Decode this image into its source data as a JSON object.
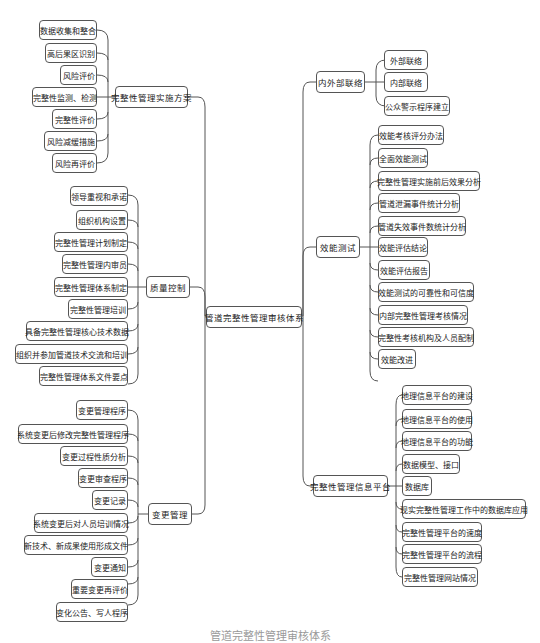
{
  "diagram": {
    "center": "管道完整性管理审核体系",
    "left_branches": [
      {
        "label": "完整性管理实施方案",
        "children": [
          "数据收集和整合",
          "高后果区识别",
          "风险评价",
          "完整性监测、检测",
          "完整性评价",
          "风险减缓措施",
          "风险再评价"
        ]
      },
      {
        "label": "质量控制",
        "children": [
          "领导重视和承诺",
          "组织机构设置",
          "完整性管理计划制定",
          "完整性管理内审员",
          "完整性管理体系制定",
          "完整性管理培训",
          "具备完整性管理核心技术数据",
          "组织并参加管道技术交流和培训",
          "完整性管理体系文件要点"
        ]
      },
      {
        "label": "变更管理",
        "children": [
          "变更管理程序",
          "系统变更后修改完整性管理程序",
          "变更过程性质分析",
          "变更审查程序",
          "变更记录",
          "系统变更后对人员培训情况",
          "新技术、新成果使用形成文件",
          "变更通知",
          "重要变更再评价",
          "变化公告、写人程序"
        ]
      }
    ],
    "right_branches": [
      {
        "label": "内外部联络",
        "children": [
          "外部联络",
          "内部联络",
          "公众警示程序建立"
        ]
      },
      {
        "label": "效能测试",
        "children": [
          "效能考核评分办法",
          "全面效能测试",
          "完整性管理实施前后效果分析",
          "管道泄漏事件统计分析",
          "管道失效事件数统计分析",
          "效能评估结论",
          "效能评估报告",
          "效能测试的可靠性和可信度",
          "内部完整性管理考核情况",
          "完整性考核机构及人员配制",
          "效能改进"
        ]
      },
      {
        "label": "完整性管理信息平台",
        "children": [
          "地理信息平台的建设",
          "地理信息平台的使用",
          "地理信息平台的功能",
          "数据模型、接口",
          "数据库",
          "现实完整性管理工作中的数据库应用",
          "完整性管理平台的速度",
          "完整性管理平台的流程",
          "完整性管理网站情况"
        ]
      }
    ],
    "caption": "管道完整性管理审核体系"
  },
  "colors": {
    "line": "#555555",
    "border": "#555555",
    "text": "#222222"
  }
}
